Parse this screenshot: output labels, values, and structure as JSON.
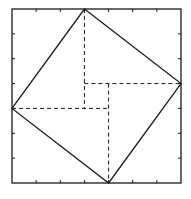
{
  "diagram": {
    "title": "",
    "type": "geometric-proof",
    "grid_units": 7,
    "frame": {
      "x0": 12,
      "y0": 9,
      "x1": 181,
      "y1": 183
    },
    "ticks_per_side": 6,
    "outer_square": {
      "corners": [
        [
          0,
          0
        ],
        [
          7,
          0
        ],
        [
          7,
          7
        ],
        [
          0,
          7
        ]
      ]
    },
    "inner_square": {
      "vertices": [
        [
          3,
          7
        ],
        [
          7,
          4
        ],
        [
          4,
          0
        ],
        [
          0,
          3
        ]
      ]
    },
    "dashed_lines": [
      {
        "from": [
          3,
          7
        ],
        "to": [
          3,
          3
        ]
      },
      {
        "from": [
          3,
          4
        ],
        "to": [
          7,
          4
        ]
      },
      {
        "from": [
          0,
          3
        ],
        "to": [
          4,
          3
        ]
      },
      {
        "from": [
          4,
          4
        ],
        "to": [
          4,
          0
        ]
      }
    ],
    "colors": {
      "stroke": "#1a1a1a",
      "background": "#ffffff"
    }
  }
}
